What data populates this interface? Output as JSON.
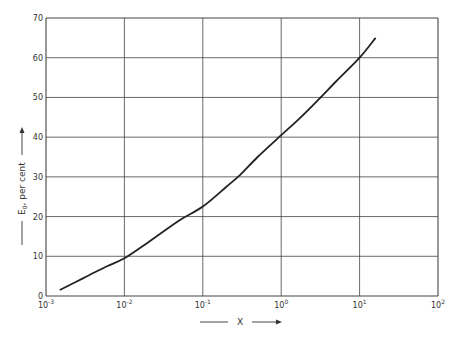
{
  "chart_data": {
    "type": "line",
    "title": "",
    "xlabel": "X",
    "ylabel": "E0, per cent",
    "xscale": "log",
    "xlim": [
      0.001,
      100
    ],
    "ylim": [
      0,
      70
    ],
    "grid": true,
    "x_ticks": [
      "10^-3",
      "10^-2",
      "10^-1",
      "10^0",
      "10^1",
      "10^2"
    ],
    "y_ticks": [
      0,
      10,
      20,
      30,
      40,
      50,
      60,
      70
    ],
    "series": [
      {
        "name": "E0",
        "x": [
          0.0015,
          0.003,
          0.006,
          0.01,
          0.02,
          0.05,
          0.1,
          0.2,
          0.3,
          0.5,
          1,
          2,
          5,
          10,
          16
        ],
        "y": [
          1.5,
          4.5,
          7.5,
          9.5,
          13.5,
          19,
          22.5,
          27.5,
          30.5,
          35,
          40.5,
          46,
          54,
          60,
          65
        ]
      }
    ]
  },
  "labels": {
    "x_axis": "X",
    "y_axis_main": "E",
    "y_axis_sub": "0",
    "y_axis_rest": ", per cent"
  }
}
